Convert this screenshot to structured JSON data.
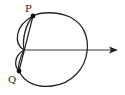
{
  "diagram": {
    "colors": {
      "stroke": "#222222",
      "background": "#ffffff"
    },
    "points": [
      {
        "id": "P",
        "label": "P",
        "x": 33,
        "y": 16
      },
      {
        "id": "Q",
        "label": "Q",
        "x": 19,
        "y": 71
      }
    ],
    "pole": {
      "x": 24,
      "y": 50
    },
    "axis": {
      "icon": "arrow-right-icon",
      "from_x": 24,
      "to_x": 118,
      "y": 50
    }
  }
}
